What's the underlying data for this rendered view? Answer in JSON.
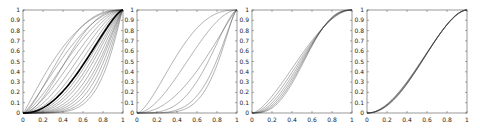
{
  "figure": {
    "background": "#ffffff",
    "axis_color": "#555555",
    "line_color": "#333333",
    "highlight_color": "#000000"
  },
  "chart_data": [
    {
      "type": "line",
      "panel": 1,
      "title": "",
      "xlabel": "",
      "ylabel": "",
      "xlim": [
        0,
        1
      ],
      "ylim": [
        0,
        1
      ],
      "xticks": [
        "0",
        "0.2",
        "0.4",
        "0.6",
        "0.8",
        "1"
      ],
      "yticks": [
        "0",
        "0.1",
        "0.2",
        "0.3",
        "0.4",
        "0.5",
        "0.6",
        "0.7",
        "0.8",
        "0.9",
        "1"
      ],
      "grid": false,
      "description": "Family of ~20 monotone increasing curves from (0,0) to (1,1), ranging from concave to strongly convex, with one thick black curve",
      "series": [
        {
          "name": "c1",
          "a": 1.1,
          "b": 2.2,
          "width": 0.5
        },
        {
          "name": "c2",
          "a": 1.3,
          "b": 2.0,
          "width": 0.5
        },
        {
          "name": "c3",
          "a": 1.5,
          "b": 1.9,
          "width": 0.5
        },
        {
          "name": "c4",
          "a": 1.7,
          "b": 1.8,
          "width": 0.5
        },
        {
          "name": "c5",
          "a": 1.9,
          "b": 1.7,
          "width": 0.5
        },
        {
          "name": "c6",
          "a": 2.1,
          "b": 1.6,
          "width": 0.5
        },
        {
          "name": "c7",
          "a": 2.3,
          "b": 1.55,
          "width": 0.5
        },
        {
          "name": "c8",
          "a": 2.5,
          "b": 1.5,
          "width": 0.5
        },
        {
          "name": "c9",
          "a": 2.7,
          "b": 1.45,
          "width": 0.5
        },
        {
          "name": "c10",
          "a": 2.9,
          "b": 1.4,
          "width": 0.5
        },
        {
          "name": "c11",
          "a": 3.2,
          "b": 1.35,
          "width": 0.5
        },
        {
          "name": "c12",
          "a": 3.5,
          "b": 1.3,
          "width": 0.5
        },
        {
          "name": "c13",
          "a": 3.9,
          "b": 1.3,
          "width": 0.5
        },
        {
          "name": "c14",
          "a": 4.3,
          "b": 1.25,
          "width": 0.5
        },
        {
          "name": "c15",
          "a": 4.8,
          "b": 1.2,
          "width": 0.5
        },
        {
          "name": "c16",
          "a": 5.3,
          "b": 1.15,
          "width": 0.5
        },
        {
          "name": "c17",
          "a": 2.0,
          "b": 2.6,
          "width": 0.5
        },
        {
          "name": "c18",
          "a": 1.6,
          "b": 2.8,
          "width": 0.5
        },
        {
          "name": "mean",
          "a": 2.2,
          "b": 1.45,
          "width": 1.6,
          "highlight": true
        }
      ]
    },
    {
      "type": "line",
      "panel": 2,
      "title": "",
      "xlabel": "",
      "ylabel": "",
      "xlim": [
        0,
        1
      ],
      "ylim": [
        0,
        1
      ],
      "xticks": [
        "0",
        "0.2",
        "0.4",
        "0.6",
        "0.8",
        "1"
      ],
      "yticks": [
        "0",
        "0.1",
        "0.2",
        "0.3",
        "0.4",
        "0.5",
        "0.6",
        "0.7",
        "0.8",
        "0.9",
        "1"
      ],
      "grid": false,
      "description": "Six monotone curves from (0,0) to (1,1) with widely varying shapes",
      "series": [
        {
          "name": "c1",
          "a": 1.6,
          "b": 2.6,
          "width": 0.5
        },
        {
          "name": "c2",
          "a": 1.9,
          "b": 1.9,
          "width": 0.5
        },
        {
          "name": "c3",
          "a": 2.1,
          "b": 1.2,
          "width": 0.5
        },
        {
          "name": "c4",
          "a": 3.5,
          "b": 1.6,
          "width": 0.5
        },
        {
          "name": "c5",
          "a": 4.5,
          "b": 1.4,
          "width": 0.5
        },
        {
          "name": "c6",
          "a": 5.5,
          "b": 1.5,
          "width": 0.5
        }
      ]
    },
    {
      "type": "line",
      "panel": 3,
      "title": "",
      "xlabel": "",
      "ylabel": "",
      "xlim": [
        0,
        1
      ],
      "ylim": [
        0,
        1
      ],
      "xticks": [
        "0",
        "0.2",
        "0.4",
        "0.6",
        "0.8",
        "1"
      ],
      "yticks": [
        "0",
        "0.1",
        "0.2",
        "0.3",
        "0.4",
        "0.5",
        "0.6",
        "0.7",
        "0.8",
        "0.9",
        "1"
      ],
      "grid": false,
      "description": "Six S-shaped curves crossing near (0.5, 0.37)",
      "series": [
        {
          "name": "c1",
          "a": 1.6,
          "b": 1.9,
          "width": 0.5
        },
        {
          "name": "c2",
          "a": 1.9,
          "b": 2.1,
          "width": 0.5
        },
        {
          "name": "c3",
          "a": 2.2,
          "b": 2.3,
          "width": 0.5
        },
        {
          "name": "c4",
          "a": 2.5,
          "b": 2.5,
          "width": 0.5
        },
        {
          "name": "c5",
          "a": 2.8,
          "b": 2.7,
          "width": 0.5
        },
        {
          "name": "c6",
          "a": 3.1,
          "b": 2.9,
          "width": 0.5
        }
      ]
    },
    {
      "type": "line",
      "panel": 4,
      "title": "",
      "xlabel": "",
      "ylabel": "",
      "xlim": [
        0,
        1
      ],
      "ylim": [
        0,
        1
      ],
      "xticks": [
        "0",
        "0.2",
        "0.4",
        "0.6",
        "0.8",
        "1"
      ],
      "yticks": [
        "0",
        "0.1",
        "0.2",
        "0.3",
        "0.4",
        "0.5",
        "0.6",
        "0.7",
        "0.8",
        "0.9",
        "1"
      ],
      "grid": false,
      "description": "Tight band of nearly identical S-shaped curves (convex then concave), passing ~(0.4,0.3),(0.6,0.55),(0.8,0.85)",
      "series": [
        {
          "name": "c1",
          "a": 2.0,
          "b": 1.75,
          "width": 0.5
        },
        {
          "name": "c2",
          "a": 2.05,
          "b": 1.78,
          "width": 0.5
        },
        {
          "name": "c3",
          "a": 2.1,
          "b": 1.8,
          "width": 0.5
        },
        {
          "name": "c4",
          "a": 2.15,
          "b": 1.83,
          "width": 0.5
        },
        {
          "name": "c5",
          "a": 2.2,
          "b": 1.86,
          "width": 0.5
        },
        {
          "name": "c6",
          "a": 2.25,
          "b": 1.9,
          "width": 0.5
        }
      ]
    }
  ]
}
